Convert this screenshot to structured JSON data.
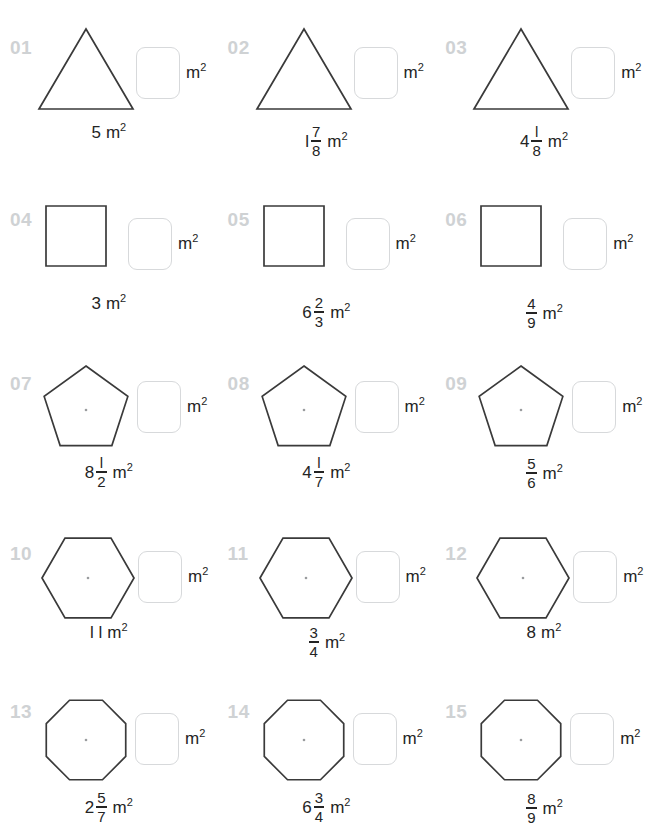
{
  "worksheet": {
    "unit_label": "m",
    "unit_sup": "2",
    "answer_unit": "m",
    "answer_unit_sup": "2",
    "colors": {
      "index": "#cfd2d4",
      "shape_stroke": "#3a3a3a",
      "spoke_stroke": "#b9bbbd",
      "answer_box_border": "#d7d9db",
      "text": "#242424"
    },
    "items": [
      {
        "index": "01",
        "shape": "triangle",
        "sides": 3,
        "value_whole": "5",
        "value_num": "",
        "value_den": "",
        "value_text": "5 m²"
      },
      {
        "index": "02",
        "shape": "triangle",
        "sides": 3,
        "value_whole": "l",
        "value_num": "7",
        "value_den": "8",
        "value_text": "1 7/8 m²"
      },
      {
        "index": "03",
        "shape": "triangle",
        "sides": 3,
        "value_whole": "4",
        "value_num": "l",
        "value_den": "8",
        "value_text": "4 1/8 m²"
      },
      {
        "index": "04",
        "shape": "square",
        "sides": 4,
        "value_whole": "3",
        "value_num": "",
        "value_den": "",
        "value_text": "3 m²"
      },
      {
        "index": "05",
        "shape": "square",
        "sides": 4,
        "value_whole": "6",
        "value_num": "2",
        "value_den": "3",
        "value_text": "6 2/3 m²"
      },
      {
        "index": "06",
        "shape": "square",
        "sides": 4,
        "value_whole": "",
        "value_num": "4",
        "value_den": "9",
        "value_text": "4/9 m²"
      },
      {
        "index": "07",
        "shape": "pentagon",
        "sides": 5,
        "value_whole": "8",
        "value_num": "l",
        "value_den": "2",
        "value_text": "8 1/2 m²"
      },
      {
        "index": "08",
        "shape": "pentagon",
        "sides": 5,
        "value_whole": "4",
        "value_num": "l",
        "value_den": "7",
        "value_text": "4 1/7 m²"
      },
      {
        "index": "09",
        "shape": "pentagon",
        "sides": 5,
        "value_whole": "",
        "value_num": "5",
        "value_den": "6",
        "value_text": "5/6 m²"
      },
      {
        "index": "10",
        "shape": "hexagon",
        "sides": 6,
        "value_whole": "l l",
        "value_num": "",
        "value_den": "",
        "value_text": "11 m²"
      },
      {
        "index": "11",
        "shape": "hexagon",
        "sides": 6,
        "value_whole": "",
        "value_num": "3",
        "value_den": "4",
        "value_text": "3/4 m²"
      },
      {
        "index": "12",
        "shape": "hexagon",
        "sides": 6,
        "value_whole": "8",
        "value_num": "",
        "value_den": "",
        "value_text": "8 m²"
      },
      {
        "index": "13",
        "shape": "octagon",
        "sides": 8,
        "value_whole": "2",
        "value_num": "5",
        "value_den": "7",
        "value_text": "2 5/7 m²"
      },
      {
        "index": "14",
        "shape": "octagon",
        "sides": 8,
        "value_whole": "6",
        "value_num": "3",
        "value_den": "4",
        "value_text": "6 3/4 m²"
      },
      {
        "index": "15",
        "shape": "octagon",
        "sides": 8,
        "value_whole": "",
        "value_num": "8",
        "value_den": "9",
        "value_text": "8/9 m²"
      }
    ]
  }
}
